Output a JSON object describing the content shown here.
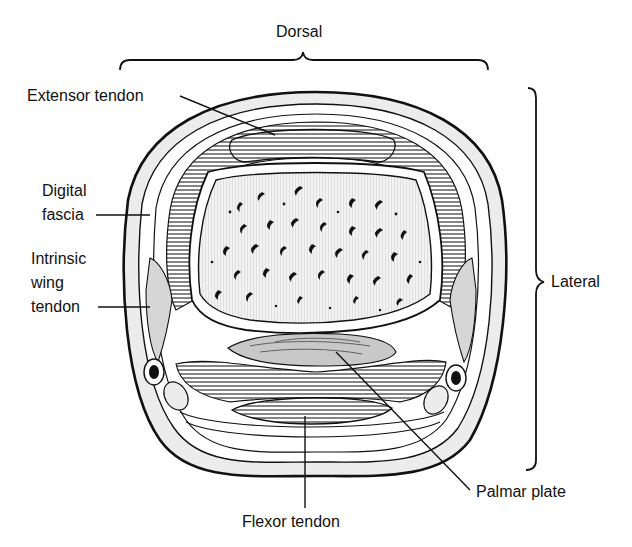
{
  "diagram": {
    "type": "anatomical cross-section"
  },
  "labels": {
    "dorsal": "Dorsal",
    "lateral": "Lateral",
    "extensor_tendon": "Extensor tendon",
    "digital_fascia_line1": "Digital",
    "digital_fascia_line2": "fascia",
    "intrinsic_line1": "Intrinsic",
    "intrinsic_line2": "wing",
    "intrinsic_line3": "tendon",
    "palmar_plate": "Palmar plate",
    "flexor_tendon": "Flexor tendon"
  },
  "colors": {
    "ink": "#111111",
    "skin_fill": "#ececec",
    "bone_fill": "#f3f3f3",
    "plate_fill": "#c8c8c8",
    "muscle_fill": "#d6d6d6",
    "background": "#ffffff"
  }
}
